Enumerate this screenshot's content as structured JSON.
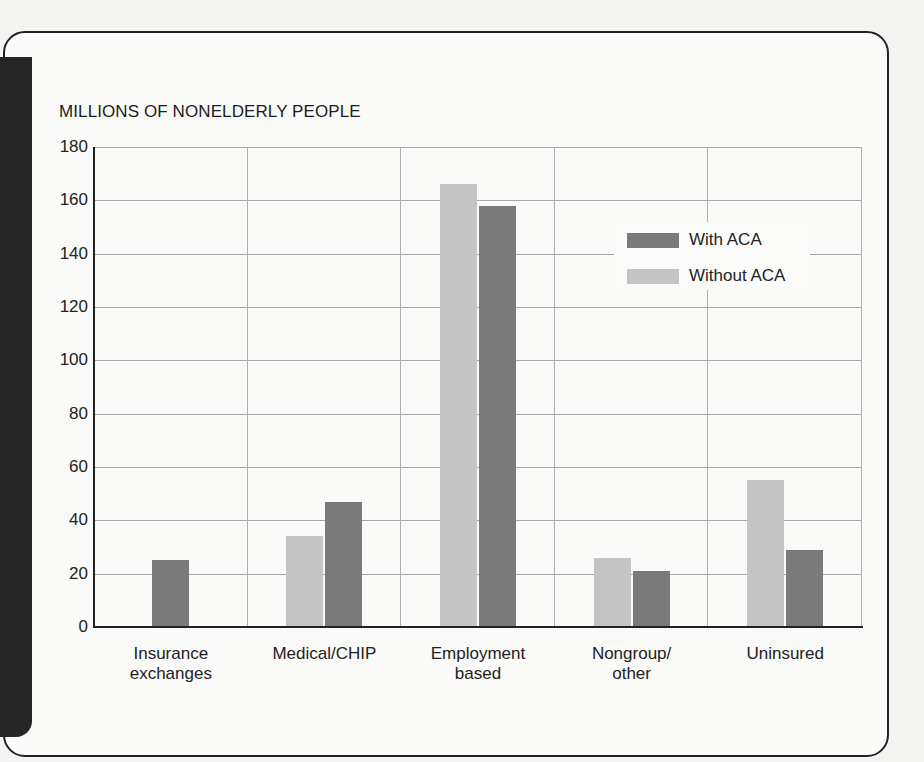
{
  "chart_data": {
    "type": "bar",
    "title": "",
    "ylabel": "MILLIONS OF NONELDERLY PEOPLE",
    "xlabel": "",
    "ylim": [
      0,
      180
    ],
    "yticks": [
      0,
      20,
      40,
      60,
      80,
      100,
      120,
      140,
      160,
      180
    ],
    "grid": true,
    "legend_position": "upper right (inside plot)",
    "categories": [
      "Insurance exchanges",
      "Medical/CHIP",
      "Employment based",
      "Nongroup/ other",
      "Uninsured"
    ],
    "category_labels": [
      [
        "Insurance",
        "exchanges"
      ],
      [
        "Medical/CHIP"
      ],
      [
        "Employment",
        "based"
      ],
      [
        "Nongroup/",
        "other"
      ],
      [
        "Uninsured"
      ]
    ],
    "series": [
      {
        "name": "Without ACA",
        "color": "#c4c4c4",
        "values": [
          0,
          34,
          166,
          26,
          55
        ]
      },
      {
        "name": "With ACA",
        "color": "#7a7a7a",
        "values": [
          25,
          47,
          158,
          21,
          29
        ]
      }
    ]
  },
  "legend": {
    "items": [
      {
        "label": "With ACA",
        "color": "#7a7a7a"
      },
      {
        "label": "Without ACA",
        "color": "#c4c4c4"
      }
    ]
  },
  "axis": {
    "y_title": "MILLIONS OF NONELDERLY PEOPLE",
    "ticks": [
      "0",
      "20",
      "40",
      "60",
      "80",
      "100",
      "120",
      "140",
      "160",
      "180"
    ]
  }
}
